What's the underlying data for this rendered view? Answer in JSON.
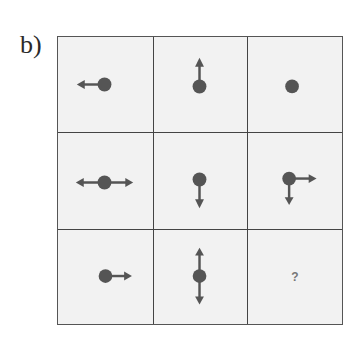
{
  "label": "b)",
  "colors": {
    "dot": "#555555",
    "border": "#444444",
    "cell_bg": "#f2f2f2",
    "question": "#777777"
  },
  "cells": [
    {
      "row": 1,
      "col": 1,
      "arrows": [
        "left"
      ]
    },
    {
      "row": 1,
      "col": 2,
      "arrows": [
        "up"
      ]
    },
    {
      "row": 1,
      "col": 3,
      "arrows": []
    },
    {
      "row": 2,
      "col": 1,
      "arrows": [
        "left",
        "right"
      ]
    },
    {
      "row": 2,
      "col": 2,
      "arrows": [
        "down"
      ]
    },
    {
      "row": 2,
      "col": 3,
      "arrows": [
        "right",
        "down"
      ]
    },
    {
      "row": 3,
      "col": 1,
      "arrows": [
        "right"
      ]
    },
    {
      "row": 3,
      "col": 2,
      "arrows": [
        "up",
        "down"
      ]
    },
    {
      "row": 3,
      "col": 3,
      "unknown": "?"
    }
  ]
}
